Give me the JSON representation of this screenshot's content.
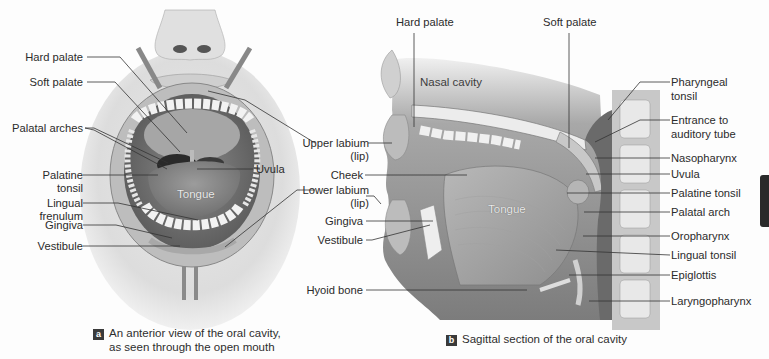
{
  "panel_a": {
    "badge": "a",
    "caption_line1": "An anterior view of the oral cavity,",
    "caption_line2": "as seen through the open mouth",
    "labels": {
      "hard_palate": "Hard palate",
      "soft_palate": "Soft palate",
      "palatal_arches": "Palatal arches",
      "palatine_tonsil_1": "Palatine",
      "palatine_tonsil_2": "tonsil",
      "lingual_frenulum_1": "Lingual",
      "lingual_frenulum_2": "frenulum",
      "gingiva": "Gingiva",
      "vestibule": "Vestibule",
      "tongue": "Tongue",
      "uvula": "Uvula"
    }
  },
  "shared_labels": {
    "upper_labium_1": "Upper labium",
    "upper_labium_2": "(lip)",
    "lower_labium_1": "Lower labium",
    "lower_labium_2": "(lip)"
  },
  "panel_b": {
    "badge": "b",
    "caption": "Sagittal section of the oral cavity",
    "labels": {
      "hard_palate": "Hard palate",
      "soft_palate": "Soft palate",
      "nasal_cavity": "Nasal cavity",
      "cheek": "Cheek",
      "gingiva": "Gingiva",
      "vestibule": "Vestibule",
      "hyoid_bone": "Hyoid bone",
      "tongue": "Tongue",
      "pharyngeal_tonsil_1": "Pharyngeal",
      "pharyngeal_tonsil_2": "tonsil",
      "entrance_auditory_1": "Entrance to",
      "entrance_auditory_2": "auditory tube",
      "nasopharynx": "Nasopharynx",
      "uvula": "Uvula",
      "palatine_tonsil": "Palatine tonsil",
      "palatal_arch": "Palatal arch",
      "oropharynx": "Oropharynx",
      "lingual_tonsil": "Lingual tonsil",
      "epiglottis": "Epiglottis",
      "laryngopharynx": "Laryngopharynx"
    }
  },
  "colors": {
    "background": "#fdfdfd",
    "leader_line": "#333333",
    "badge_bg": "#3a3a3a"
  }
}
